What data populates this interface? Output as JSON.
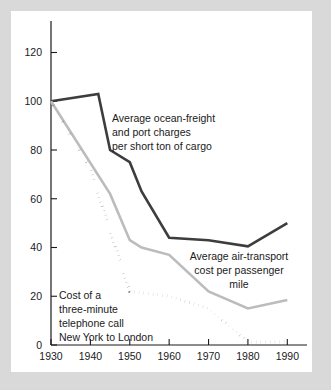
{
  "figure": {
    "background_color": "#d9d9d9",
    "panel_color": "#ffffff"
  },
  "chart_data": {
    "type": "line",
    "title": "",
    "subtitle": "",
    "xlabel": "",
    "ylabel": "",
    "xlim": [
      1930,
      1995
    ],
    "ylim": [
      0,
      128
    ],
    "xticks": [
      1930,
      1940,
      1950,
      1960,
      1970,
      1980,
      1990
    ],
    "xticklabels": [
      "1930",
      "1940",
      "1950",
      "1960",
      "1970",
      "1980",
      "1990"
    ],
    "yticks": [
      0,
      20,
      40,
      60,
      80,
      100,
      120
    ],
    "yticklabels": [
      "0",
      "20",
      "40",
      "60",
      "80",
      "100",
      "120"
    ],
    "grid": false,
    "legend": "annotations-inline",
    "series": [
      {
        "name": "Average ocean-freight and port charges per short ton of cargo",
        "color": "#3d3d3d",
        "style": "solid",
        "width": 2.6,
        "x": [
          1930,
          1942,
          1945,
          1950,
          1953,
          1960,
          1970,
          1980,
          1990
        ],
        "values": [
          100,
          103,
          80,
          75,
          63,
          44,
          43,
          40.5,
          50
        ]
      },
      {
        "name": "Average air-transport cost per passenger mile",
        "color": "#bcbcbc",
        "style": "solid",
        "width": 2.6,
        "x": [
          1930,
          1945,
          1950,
          1953,
          1960,
          1970,
          1980,
          1990
        ],
        "values": [
          100,
          62,
          43,
          40,
          37,
          22,
          15,
          18.5
        ]
      },
      {
        "name": "Cost of a three-minute telephone call New York to London",
        "color": "#2a2a2a",
        "style": "dotted",
        "width": 3.0,
        "x": [
          1930,
          1940,
          1950,
          1960,
          1970,
          1980,
          1990
        ],
        "values": [
          100,
          72,
          22,
          20,
          15,
          1.2,
          1.2
        ]
      }
    ],
    "annotations": [
      {
        "id": "ocean-freight-label",
        "align": "left",
        "lines": [
          "Average ocean-freight",
          "and port charges",
          "per short ton of cargo"
        ]
      },
      {
        "id": "air-transport-label",
        "align": "center",
        "lines": [
          "Average air-transport",
          "cost per passenger",
          "mile"
        ]
      },
      {
        "id": "telephone-label",
        "align": "left",
        "lines": [
          "Cost of a",
          "three-minute",
          "telephone call",
          "New York to London"
        ]
      }
    ]
  }
}
